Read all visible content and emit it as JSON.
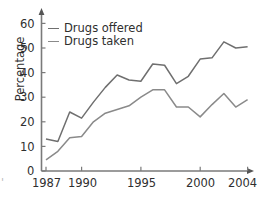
{
  "chart_data": {
    "type": "line",
    "title": "",
    "xlabel": "",
    "ylabel": "Percentage",
    "xlim": [
      1987,
      2004
    ],
    "ylim": [
      0,
      62
    ],
    "yticks": [
      0,
      10,
      20,
      30,
      40,
      50,
      60
    ],
    "xticks": [
      1987,
      1990,
      1995,
      2000,
      2004
    ],
    "xtick_labels": [
      "1987",
      "1990",
      "1995",
      "2000",
      "2004"
    ],
    "ytick_labels": [
      "0",
      "10",
      "20",
      "30",
      "40",
      "50",
      "60"
    ],
    "grid": false,
    "legend_position": "top-left",
    "x": [
      1987,
      1988,
      1989,
      1990,
      1991,
      1992,
      1993,
      1994,
      1995,
      1996,
      1997,
      1998,
      1999,
      2000,
      2001,
      2002,
      2003,
      2004
    ],
    "series": [
      {
        "name": "Drugs offered",
        "color": "#6f6f6f",
        "values": [
          13,
          12,
          24,
          21.5,
          28,
          34,
          39,
          37,
          36.5,
          43.5,
          43,
          35.5,
          38.5,
          45.5,
          46,
          52.5,
          50,
          50.5
        ]
      },
      {
        "name": "Drugs taken",
        "color": "#8a8a8a",
        "values": [
          4.5,
          8,
          13.5,
          14,
          20,
          23.5,
          25,
          26.5,
          30,
          33,
          33,
          26,
          26,
          22,
          27,
          31.5,
          26,
          29
        ]
      }
    ]
  },
  "axes": {
    "y_axis_title": "Percentage",
    "y_tick_labels": [
      "60",
      "50",
      "40",
      "30",
      "20",
      "10",
      "0"
    ],
    "x_tick_labels": [
      "1987",
      "1990",
      "1995",
      "2000",
      "2004"
    ],
    "axis_color": "#7a7a7a"
  },
  "legend": {
    "items": [
      {
        "label": "Drugs offered",
        "color": "#6f6f6f"
      },
      {
        "label": "Drugs taken",
        "color": "#8a8a8a"
      }
    ]
  },
  "artifacts": {
    "left_edge_mark": "'"
  }
}
